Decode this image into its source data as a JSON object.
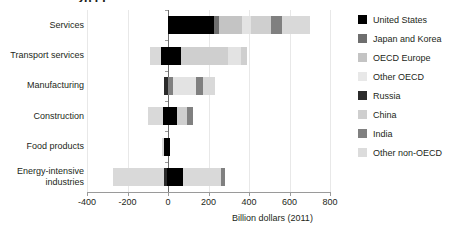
{
  "title_fragment": "2011",
  "chart_data": {
    "type": "bar",
    "orientation": "horizontal",
    "stacked": true,
    "title": "",
    "xlabel": "Billion dollars (2011)",
    "ylabel": "",
    "xlim": [
      -400,
      800
    ],
    "xticks": [
      -400,
      -200,
      0,
      200,
      400,
      600,
      800
    ],
    "xtick_labels": [
      "-400",
      "-200",
      "0",
      "200",
      "400",
      "600",
      "800"
    ],
    "grid": true,
    "legend_position": "right",
    "categories": [
      "Services",
      "Transport services",
      "Manufacturing",
      "Construction",
      "Food products",
      "Energy-intensive industries"
    ],
    "series": [
      {
        "name": "United States",
        "color": "#000000",
        "values": [
          225,
          100,
          -6,
          30,
          18,
          72
        ]
      },
      {
        "name": "Japan and Korea",
        "color": "#6e6e6e",
        "values": [
          28,
          0,
          -12,
          0,
          0,
          0
        ]
      },
      {
        "name": "OECD Europe",
        "color": "#c4c4c4",
        "values": [
          112,
          0,
          0,
          0,
          0,
          0
        ]
      },
      {
        "name": "Other OECD",
        "color": "#e3e3e3",
        "values": [
          45,
          0,
          80,
          0,
          0,
          0
        ]
      },
      {
        "name": "Russia",
        "color": "#2b2b2b",
        "values": [
          0,
          0,
          0,
          -18,
          -12,
          -18
        ]
      },
      {
        "name": "China",
        "color": "#cfcfcf",
        "values": [
          100,
          230,
          0,
          40,
          0,
          0
        ]
      },
      {
        "name": "India",
        "color": "#808080",
        "values": [
          55,
          0,
          22,
          18,
          0,
          18
        ]
      },
      {
        "name": "Other non-OECD",
        "color": "#d9d9d9",
        "values": [
          135,
          145,
          38,
          -100,
          -6,
          -250
        ]
      }
    ],
    "bars": [
      {
        "category": "Services",
        "negative_total": 0,
        "positive_total": 700,
        "segments": [
          {
            "name": "United States",
            "start": 0,
            "end": 225,
            "color": "#000000"
          },
          {
            "name": "Japan and Korea",
            "start": 225,
            "end": 253,
            "color": "#6e6e6e"
          },
          {
            "name": "OECD Europe",
            "start": 253,
            "end": 365,
            "color": "#c4c4c4"
          },
          {
            "name": "Other OECD",
            "start": 365,
            "end": 410,
            "color": "#e3e3e3"
          },
          {
            "name": "China",
            "start": 410,
            "end": 510,
            "color": "#cfcfcf"
          },
          {
            "name": "India",
            "start": 510,
            "end": 565,
            "color": "#808080"
          },
          {
            "name": "Other non-OECD",
            "start": 565,
            "end": 700,
            "color": "#d9d9d9"
          }
        ]
      },
      {
        "category": "Transport services",
        "negative_total": -90,
        "positive_total": 390,
        "segments": [
          {
            "name": "Other non-OECD",
            "start": -90,
            "end": -35,
            "color": "#d9d9d9"
          },
          {
            "name": "United States",
            "start": -35,
            "end": 65,
            "color": "#000000"
          },
          {
            "name": "China",
            "start": 65,
            "end": 295,
            "color": "#cfcfcf"
          },
          {
            "name": "Other OECD",
            "start": 295,
            "end": 360,
            "color": "#e3e3e3"
          },
          {
            "name": "Other non-OECD",
            "start": 360,
            "end": 390,
            "color": "#cfcfcf"
          }
        ]
      },
      {
        "category": "Manufacturing",
        "negative_total": -20,
        "positive_total": 230,
        "segments": [
          {
            "name": "United States",
            "start": -20,
            "end": 2,
            "color": "#2b2b2b"
          },
          {
            "name": "Japan and Korea",
            "start": 2,
            "end": 25,
            "color": "#808080"
          },
          {
            "name": "Other OECD",
            "start": 25,
            "end": 140,
            "color": "#e3e3e3"
          },
          {
            "name": "India",
            "start": 140,
            "end": 172,
            "color": "#808080"
          },
          {
            "name": "Other non-OECD",
            "start": 172,
            "end": 230,
            "color": "#d9d9d9"
          }
        ]
      },
      {
        "category": "Construction",
        "negative_total": -100,
        "positive_total": 122,
        "segments": [
          {
            "name": "Other non-OECD",
            "start": -100,
            "end": -25,
            "color": "#d9d9d9"
          },
          {
            "name": "Russia",
            "start": -25,
            "end": 45,
            "color": "#000000"
          },
          {
            "name": "China",
            "start": 45,
            "end": 95,
            "color": "#cfcfcf"
          },
          {
            "name": "India",
            "start": 95,
            "end": 122,
            "color": "#808080"
          }
        ]
      },
      {
        "category": "Food products",
        "negative_total": -30,
        "positive_total": 12,
        "segments": [
          {
            "name": "Other non-OECD",
            "start": -30,
            "end": -18,
            "color": "#d9d9d9"
          },
          {
            "name": "Russia",
            "start": -18,
            "end": 12,
            "color": "#000000"
          }
        ]
      },
      {
        "category": "Energy-intensive industries",
        "negative_total": -270,
        "positive_total": 282,
        "segments": [
          {
            "name": "Other non-OECD",
            "start": -270,
            "end": -22,
            "color": "#d9d9d9"
          },
          {
            "name": "Russia",
            "start": -22,
            "end": -4,
            "color": "#2b2b2b"
          },
          {
            "name": "United States",
            "start": -4,
            "end": 72,
            "color": "#000000"
          },
          {
            "name": "China",
            "start": 72,
            "end": 262,
            "color": "#d9d9d9"
          },
          {
            "name": "India",
            "start": 262,
            "end": 282,
            "color": "#808080"
          }
        ]
      }
    ]
  },
  "legend": {
    "items": [
      {
        "label": "United States",
        "color": "#000000"
      },
      {
        "label": "Japan and Korea",
        "color": "#6e6e6e"
      },
      {
        "label": "OECD Europe",
        "color": "#c4c4c4"
      },
      {
        "label": "Other OECD",
        "color": "#e8e8e8"
      },
      {
        "label": "Russia",
        "color": "#2b2b2b"
      },
      {
        "label": "China",
        "color": "#cfcfcf"
      },
      {
        "label": "India",
        "color": "#808080"
      },
      {
        "label": "Other non-OECD",
        "color": "#dcdcdc"
      }
    ]
  }
}
